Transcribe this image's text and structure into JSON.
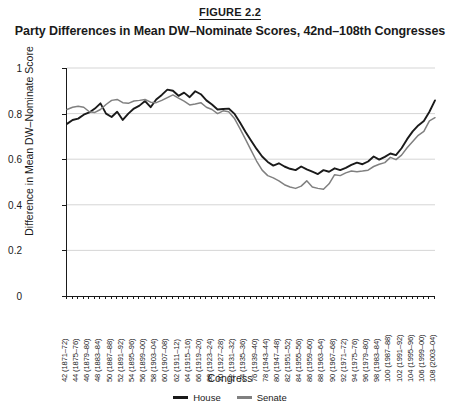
{
  "figure": {
    "number": "FIGURE 2.2",
    "title": "Party Differences in Mean DW–Nominate Scores, 42nd–108th Congresses"
  },
  "colors": {
    "house": "#1a1a1a",
    "senate": "#808080",
    "grid": "#d0d0d0",
    "axis": "#1a1a1a",
    "background": "#ffffff"
  },
  "legend": {
    "position": "bottom-center",
    "entries": [
      {
        "label": "House",
        "color": "#1a1a1a"
      },
      {
        "label": "Senate",
        "color": "#808080"
      }
    ]
  },
  "chart_data": {
    "type": "line",
    "title": "Party Differences in Mean DW–Nominate Scores, 42nd–108th Congresses",
    "xlabel": "Congress",
    "ylabel": "Difference in Mean DW–Nominate Score",
    "ylim": [
      0,
      1
    ],
    "yticks": [
      0,
      0.2,
      0.4,
      0.6,
      0.8,
      1
    ],
    "ytick_labels": [
      "0",
      "0.2",
      "0.4",
      "0.6",
      "0.8",
      "1"
    ],
    "grid": "horizontal",
    "legend_position": "bottom-center",
    "categories": [
      "42 (1871–72)",
      "43 (1873–74)",
      "44 (1875–76)",
      "45 (1877–78)",
      "46 (1879–80)",
      "47 (1881–82)",
      "48 (1883–84)",
      "49 (1885–86)",
      "50 (1887–88)",
      "51 (1889–90)",
      "52 (1891–92)",
      "53 (1893–94)",
      "54 (1895–96)",
      "55 (1897–98)",
      "56 (1899–00)",
      "57 (1901–02)",
      "58 (1903–04)",
      "59 (1905–06)",
      "60 (1907–08)",
      "61 (1909–10)",
      "62 (1911–12)",
      "63 (1913–14)",
      "64 (1915–16)",
      "65 (1917–18)",
      "66 (1919–20)",
      "67 (1921–22)",
      "68 (1923–24)",
      "69 (1925–26)",
      "70 (1927–28)",
      "71 (1929–30)",
      "72 (1931–32)",
      "73 (1933–34)",
      "74 (1935–36)",
      "75 (1937–38)",
      "76 (1939–40)",
      "77 (1941–42)",
      "78 (1943–44)",
      "79 (1945–46)",
      "80 (1947–48)",
      "81 (1949–50)",
      "82 (1951–52)",
      "83 (1953–54)",
      "84 (1955–56)",
      "85 (1957–58)",
      "86 (1959–60)",
      "87 (1961–62)",
      "88 (1963–64)",
      "89 (1965–66)",
      "90 (1967–68)",
      "91 (1969–70)",
      "92 (1971–72)",
      "93 (1973–74)",
      "94 (1975–76)",
      "95 (1977–78)",
      "96 (1979–80)",
      "97 (1981–82)",
      "98 (1983–84)",
      "99 (1985–86)",
      "100 (1987–88)",
      "101 (1989–90)",
      "102 (1991–92)",
      "103 (1993–94)",
      "104 (1995–96)",
      "105 (1997–98)",
      "106 (1999–00)",
      "107 (2001–02)",
      "108 (2003–04)"
    ],
    "tick_label_every": 2,
    "series": [
      {
        "name": "House",
        "color": "#1a1a1a",
        "values": [
          0.755,
          0.772,
          0.778,
          0.795,
          0.805,
          0.822,
          0.845,
          0.8,
          0.785,
          0.808,
          0.772,
          0.8,
          0.822,
          0.835,
          0.855,
          0.828,
          0.862,
          0.882,
          0.905,
          0.9,
          0.878,
          0.892,
          0.872,
          0.898,
          0.885,
          0.858,
          0.84,
          0.818,
          0.82,
          0.822,
          0.8,
          0.762,
          0.72,
          0.682,
          0.645,
          0.612,
          0.588,
          0.572,
          0.582,
          0.568,
          0.558,
          0.552,
          0.568,
          0.555,
          0.545,
          0.535,
          0.552,
          0.545,
          0.56,
          0.552,
          0.562,
          0.575,
          0.585,
          0.578,
          0.59,
          0.612,
          0.598,
          0.61,
          0.625,
          0.618,
          0.648,
          0.688,
          0.722,
          0.748,
          0.768,
          0.808,
          0.858
        ]
      },
      {
        "name": "Senate",
        "color": "#808080",
        "values": [
          0.818,
          0.828,
          0.832,
          0.828,
          0.808,
          0.805,
          0.818,
          0.84,
          0.858,
          0.862,
          0.848,
          0.845,
          0.855,
          0.858,
          0.862,
          0.85,
          0.848,
          0.858,
          0.87,
          0.882,
          0.868,
          0.855,
          0.838,
          0.842,
          0.848,
          0.828,
          0.818,
          0.8,
          0.812,
          0.808,
          0.78,
          0.735,
          0.688,
          0.64,
          0.592,
          0.552,
          0.528,
          0.518,
          0.505,
          0.488,
          0.478,
          0.472,
          0.482,
          0.505,
          0.478,
          0.472,
          0.468,
          0.492,
          0.532,
          0.528,
          0.54,
          0.548,
          0.545,
          0.548,
          0.552,
          0.568,
          0.578,
          0.585,
          0.608,
          0.598,
          0.618,
          0.65,
          0.678,
          0.705,
          0.722,
          0.768,
          0.782
        ]
      }
    ]
  }
}
